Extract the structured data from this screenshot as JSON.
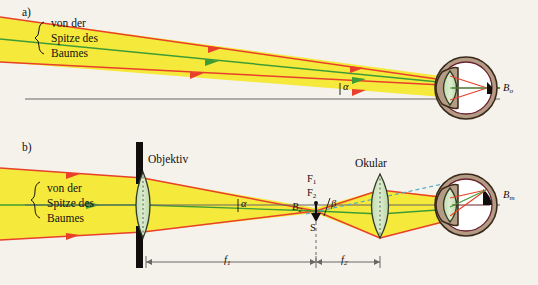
{
  "figure": {
    "background_color": "#f5f2ec",
    "panels": [
      {
        "tag": "a)",
        "description": "Betrachtung mit blossem Auge",
        "angle_label": "α",
        "image_label": "B",
        "image_sub": "o",
        "source_text_lines": [
          "von der",
          "Spitze des",
          "Baumes"
        ]
      },
      {
        "tag": "b)",
        "description": "Betrachtung durch das Fernrohr",
        "objective_label": "Objektiv",
        "eyepiece_label": "Okular",
        "angle_label": "β",
        "angle_label_objective": "α",
        "image_label": "B",
        "image_sub": "m",
        "intermediate_image_label": "B",
        "intermediate_image_sub": "2",
        "focal_point_1": "F",
        "focal_point_1_sub": "1",
        "focal_point_2": "F",
        "focal_point_2_sub": "2",
        "screen_label": "S",
        "focal_length_1": "f",
        "focal_length_1_sub": "1",
        "focal_length_2": "f",
        "focal_length_2_sub": "2",
        "source_text_lines": [
          "von der",
          "Spitze des",
          "Baumes"
        ]
      }
    ],
    "colors": {
      "beam_fill": "#f5e93c",
      "ray_red": "#e8402a",
      "ray_green": "#3f9c35",
      "axis_gray": "#6b6664",
      "lens_fill": "#cfe3bd",
      "lens_stroke": "#2f3b26",
      "eye_sclera": "#b39c83",
      "eye_inner": "#6b2230",
      "aperture_black": "#100d0c",
      "construction_blue": "#4fa8c8",
      "label_black": "#141110"
    }
  }
}
